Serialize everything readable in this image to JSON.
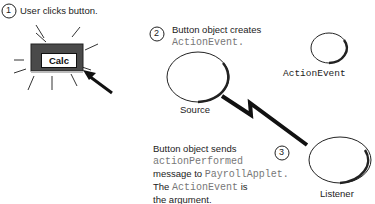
{
  "steps": [
    {
      "number": "1",
      "text": "User clicks button."
    },
    {
      "number": "2",
      "text_line1": "Button object creates",
      "text_line2_code": "ActionEvent",
      "text_line2_suffix": "."
    },
    {
      "number": "3",
      "line1": "Button object sends",
      "line2_code": "actionPerformed",
      "line3_prefix": "message to ",
      "line3_code": "PayrollApplet",
      "line3_suffix": ".",
      "line4_prefix": "The ",
      "line4_code": "ActionEvent",
      "line4_suffix": " is",
      "line5": "the argument."
    }
  ],
  "button": {
    "label": "Calc"
  },
  "objects": {
    "source": "Source",
    "action_event": "ActionEvent",
    "listener": "Listener"
  }
}
